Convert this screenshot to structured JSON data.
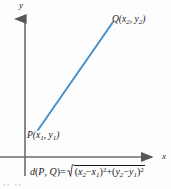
{
  "figure": {
    "background_color": "#fdfdfd"
  },
  "axes": {
    "x_label": "x",
    "y_label": "y",
    "axis_color": "#58585c",
    "origin": {
      "x": 25,
      "y": 157
    },
    "x_axis_from_x": 0,
    "x_axis_to_x": 158,
    "y_axis_from_y": 12,
    "y_axis_to_y": 176,
    "arrowheads": true,
    "ticks": false,
    "grid": false
  },
  "segment": {
    "color": "#4a90c8",
    "width_px": 2,
    "start": {
      "x": 38,
      "y": 130
    },
    "end": {
      "x": 113,
      "y": 22
    }
  },
  "points": {
    "p": {
      "name": "P",
      "label_prefix": "P(",
      "x_var": "x",
      "x_sub": "1",
      "separator": ", ",
      "y_var": "y",
      "y_sub": "1",
      "label_suffix": ")"
    },
    "q": {
      "name": "Q",
      "label_prefix": "Q(",
      "x_var": "x",
      "x_sub": "2",
      "separator": ", ",
      "y_var": "y",
      "y_sub": "2",
      "label_suffix": ")"
    }
  },
  "formula": {
    "plain": "d(P, Q) = sqrt((x2 - x1)^2 + (y2 - y1)^2)",
    "lhs_d": "d",
    "lhs_open": "(",
    "lhs_p": "P",
    "lhs_comma": ", ",
    "lhs_q": "Q",
    "lhs_close": ")",
    "equals": "=",
    "term1_open": "(",
    "term1_x2": "x",
    "term1_x2_sub": "2",
    "term1_minus": "−",
    "term1_x1": "x",
    "term1_x1_sub": "1",
    "term1_close": ")",
    "term1_exp": "2",
    "plus": "+",
    "term2_open": "(",
    "term2_y2": "y",
    "term2_y2_sub": "2",
    "term2_minus": "−",
    "term2_y1": "y",
    "term2_y1_sub": "1",
    "term2_close": ")",
    "term2_exp": "2"
  },
  "caption_sliver": {
    "text": "••  ••"
  }
}
